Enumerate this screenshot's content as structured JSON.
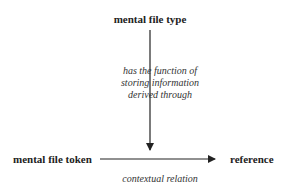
{
  "diagram": {
    "nodes": {
      "type": "mental file type",
      "token": "mental file token",
      "reference": "reference"
    },
    "edges": [
      {
        "from": "mental file type",
        "to": "contextual relation",
        "label_lines": [
          "has the function of",
          "storing information",
          "derived through"
        ]
      },
      {
        "from": "mental file token",
        "to": "reference",
        "label": "contextual relation"
      }
    ],
    "colors": {
      "text": "#222222",
      "arrow": "#222222"
    }
  }
}
